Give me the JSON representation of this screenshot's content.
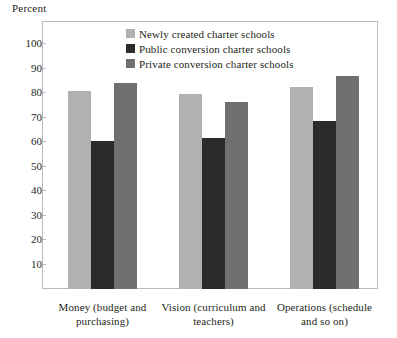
{
  "chart_data": {
    "type": "bar",
    "title": "",
    "subtitle": "",
    "xlabel": "",
    "ylabel": "Percent",
    "ylim": [
      0,
      105
    ],
    "ytick_values": [
      10,
      20,
      30,
      40,
      50,
      60,
      70,
      80,
      90,
      100
    ],
    "ytick_labels": [
      "10",
      "20",
      "30",
      "40",
      "50",
      "60",
      "70",
      "80",
      "90",
      "100"
    ],
    "grid": false,
    "legend_position": "top-center",
    "categories": [
      "Money (budget and purchasing)",
      "Vision (curriculum and teachers)",
      "Operations (schedule and so on)"
    ],
    "category_lines": [
      [
        "Money (budget and",
        "purchasing)"
      ],
      [
        "Vision (curriculum and",
        "teachers)"
      ],
      [
        "Operations (schedule",
        "and so on)"
      ]
    ],
    "series": [
      {
        "name": "Newly created charter schools",
        "color": "#b1b1b1",
        "values": [
          81,
          79.5,
          82.5
        ]
      },
      {
        "name": "Public conversion charter schools",
        "color": "#2b2b2b",
        "values": [
          60.5,
          61.5,
          68.5
        ]
      },
      {
        "name": "Private conversion charter schools",
        "color": "#707070",
        "values": [
          84,
          76.5,
          87
        ]
      }
    ],
    "frame_color": "#b9b9b9"
  },
  "legend": {
    "items": [
      {
        "label": "Newly created charter schools",
        "color": "#b1b1b1"
      },
      {
        "label": "Public conversion charter schools",
        "color": "#2b2b2b"
      },
      {
        "label": "Private conversion charter schools",
        "color": "#707070"
      }
    ]
  }
}
